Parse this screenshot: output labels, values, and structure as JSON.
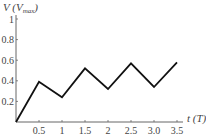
{
  "chart_data": {
    "type": "line",
    "title": "",
    "ylabel": "V (Vmax)",
    "ylabel_main": "V (V",
    "ylabel_sub": "max",
    "ylabel_close": ")",
    "xlabel": "t (T)",
    "xlim": [
      0,
      3.5
    ],
    "ylim": [
      0,
      1
    ],
    "xticks": [
      "0.5",
      "1",
      "1.5",
      "2",
      "2.5",
      "3.0",
      "3.5"
    ],
    "xtick_values": [
      0.5,
      1,
      1.5,
      2,
      2.5,
      3.0,
      3.5
    ],
    "yticks": [
      "0.2",
      "0.4",
      "0.6",
      "0.8",
      "1"
    ],
    "ytick_values": [
      0.2,
      0.4,
      0.6,
      0.8,
      1
    ],
    "grid": false,
    "series": [
      {
        "name": "V(t)",
        "x": [
          0,
          0.5,
          1.0,
          1.5,
          2.0,
          2.5,
          3.0,
          3.5
        ],
        "values": [
          0,
          0.39,
          0.24,
          0.52,
          0.32,
          0.57,
          0.34,
          0.58
        ]
      }
    ],
    "line_color": "#111111",
    "axis_color": "#666666"
  }
}
